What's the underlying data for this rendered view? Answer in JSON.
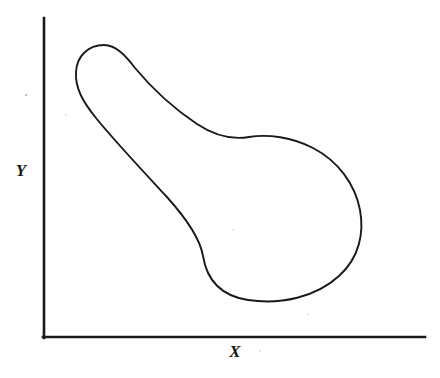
{
  "figure": {
    "title": "",
    "background_color": "#ffffff",
    "ink_color": "#1a1a1a",
    "width": 440,
    "height": 378
  },
  "axes": {
    "x_axis": {
      "label": "X",
      "label_x": 235,
      "label_y": 353,
      "start_x": 44,
      "start_y": 337,
      "end_x": 425,
      "end_y": 337,
      "ticks": [],
      "tick_labels": []
    },
    "y_axis": {
      "label": "Y",
      "label_x": 21,
      "label_y": 172,
      "start_x": 44,
      "start_y": 18,
      "end_x": 44,
      "end_y": 337,
      "ticks": [],
      "tick_labels": []
    }
  },
  "chart_data": {
    "type": "line",
    "title": "",
    "subtitle": "",
    "xlabel": "X",
    "ylabel": "Y",
    "grid": false,
    "legend": [],
    "legend_position": "none",
    "annotations": [],
    "xlim": [
      44,
      425
    ],
    "ylim": [
      18,
      337
    ],
    "axis_tick_labels_x": [],
    "axis_tick_labels_y": [],
    "series": [
      {
        "name": "region-outline",
        "closed": true,
        "fill": "none",
        "stroke": "#1a1a1a",
        "path": "M 104,45 C 88,45 77,56 76,72 C 75,88 83,102 96,118 C 112,138 140,168 166,196 C 186,218 200,238 203,256 C 207,281 222,296 248,300 C 281,305 316,297 339,276 C 360,257 364,232 360,210 C 355,184 338,161 313,148 C 292,137 268,134 249,137 C 231,140 215,136 197,124 C 173,108 150,86 135,68 C 126,56 116,45 104,45 Z",
        "points": [
          [
            104,
            45
          ],
          [
            88,
            45
          ],
          [
            77,
            56
          ],
          [
            76,
            72
          ],
          [
            75,
            88
          ],
          [
            83,
            102
          ],
          [
            96,
            118
          ],
          [
            112,
            138
          ],
          [
            140,
            168
          ],
          [
            166,
            196
          ],
          [
            186,
            218
          ],
          [
            200,
            238
          ],
          [
            203,
            256
          ],
          [
            207,
            281
          ],
          [
            222,
            296
          ],
          [
            248,
            300
          ],
          [
            281,
            305
          ],
          [
            316,
            297
          ],
          [
            339,
            276
          ],
          [
            360,
            257
          ],
          [
            364,
            232
          ],
          [
            360,
            210
          ],
          [
            355,
            184
          ],
          [
            338,
            161
          ],
          [
            313,
            148
          ],
          [
            292,
            137
          ],
          [
            268,
            134
          ],
          [
            249,
            137
          ],
          [
            231,
            140
          ],
          [
            215,
            136
          ],
          [
            197,
            124
          ],
          [
            173,
            108
          ],
          [
            150,
            86
          ],
          [
            135,
            68
          ],
          [
            126,
            56
          ],
          [
            116,
            45
          ],
          [
            104,
            45
          ]
        ],
        "extrema": {
          "topmost": [
            108,
            44
          ],
          "leftmost": [
            76,
            76
          ],
          "rightmost": [
            363,
            226
          ],
          "bottommost": [
            290,
            303
          ]
        }
      }
    ]
  },
  "specks": [
    {
      "x": 26,
      "y": 95,
      "r": 1.2
    },
    {
      "x": 66,
      "y": 115,
      "r": 0.9
    },
    {
      "x": 233,
      "y": 230,
      "r": 0.9
    },
    {
      "x": 308,
      "y": 314,
      "r": 0.9
    },
    {
      "x": 260,
      "y": 351,
      "r": 0.9
    }
  ]
}
